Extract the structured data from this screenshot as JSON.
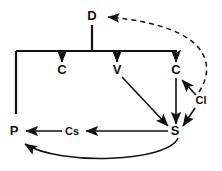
{
  "diagram": {
    "background_color": "#ffffff",
    "stroke_color": "#111111",
    "nodes": [
      {
        "id": "D",
        "label": "D",
        "x": 92,
        "y": 17
      },
      {
        "id": "C1",
        "label": "C",
        "x": 62,
        "y": 70
      },
      {
        "id": "V",
        "label": "V",
        "x": 117,
        "y": 70
      },
      {
        "id": "C2",
        "label": "C",
        "x": 176,
        "y": 70
      },
      {
        "id": "Cl",
        "label": "Cl",
        "x": 200,
        "y": 101
      },
      {
        "id": "P",
        "label": "P",
        "x": 14,
        "y": 132
      },
      {
        "id": "Cs",
        "label": "Cs",
        "x": 72,
        "y": 132
      },
      {
        "id": "S",
        "label": "S",
        "x": 175,
        "y": 132
      }
    ],
    "edges": [
      {
        "id": "edge-cl-to-d",
        "from": "Cl",
        "to": "D",
        "style": "dashed",
        "shape": "curve",
        "arrow": true
      },
      {
        "id": "edge-d-to-bus",
        "from": "D",
        "to": "bus",
        "style": "solid",
        "shape": "vertical",
        "arrow": false
      },
      {
        "id": "edge-bus",
        "from": "bus",
        "to": "bus",
        "style": "solid",
        "shape": "horizontal",
        "arrow": false
      },
      {
        "id": "edge-bus-to-left",
        "from": "bus",
        "to": "P",
        "style": "solid",
        "shape": "vertical",
        "arrow": false
      },
      {
        "id": "edge-bus-to-c1",
        "from": "bus",
        "to": "C1",
        "style": "solid",
        "shape": "vertical",
        "arrow": true
      },
      {
        "id": "edge-bus-to-v",
        "from": "bus",
        "to": "V",
        "style": "solid",
        "shape": "vertical",
        "arrow": true
      },
      {
        "id": "edge-bus-to-c2",
        "from": "bus",
        "to": "C2",
        "style": "solid",
        "shape": "vertical",
        "arrow": true
      },
      {
        "id": "edge-v-to-s",
        "from": "V",
        "to": "S",
        "style": "solid",
        "shape": "diagonal",
        "arrow": true
      },
      {
        "id": "edge-c2-to-s",
        "from": "C2",
        "to": "S",
        "style": "solid",
        "shape": "vertical",
        "arrow": true
      },
      {
        "id": "edge-cl-to-c2",
        "from": "Cl",
        "to": "C2",
        "style": "solid",
        "shape": "diagonal",
        "arrow": true
      },
      {
        "id": "edge-cl-to-s",
        "from": "Cl",
        "to": "S",
        "style": "solid",
        "shape": "diagonal",
        "arrow": true
      },
      {
        "id": "edge-s-to-cs",
        "from": "S",
        "to": "Cs",
        "style": "solid",
        "shape": "horizontal",
        "arrow": true
      },
      {
        "id": "edge-cs-to-p",
        "from": "Cs",
        "to": "P",
        "style": "solid",
        "shape": "horizontal",
        "arrow": true
      },
      {
        "id": "edge-s-to-p-curve",
        "from": "S",
        "to": "P",
        "style": "solid",
        "shape": "curve",
        "arrow": true
      }
    ]
  }
}
